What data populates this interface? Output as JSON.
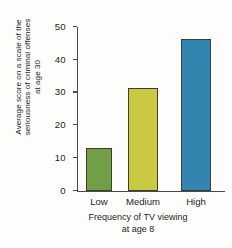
{
  "chart_data": {
    "type": "bar",
    "title": "",
    "categories": [
      "Low",
      "Medium",
      "High"
    ],
    "values": [
      12.5,
      31,
      46
    ],
    "series": [
      {
        "name": "Average seriousness score at age 30",
        "values": [
          12.5,
          31,
          46
        ]
      }
    ],
    "xlabel": "Frequency of TV viewing at age 8",
    "xlabel_lines": [
      "Frequency of TV viewing",
      "at age 8"
    ],
    "ylabel": "Average score on a scale of the seriousness of criminal offenses at age 30",
    "ylabel_lines": [
      "Average score on a scale of the",
      "seriousness of criminal offenses",
      "at age 30"
    ],
    "ylim": [
      0,
      50
    ],
    "yticks": [
      0,
      10,
      20,
      30,
      40,
      50
    ],
    "ytick_labels": [
      "0",
      "10",
      "20",
      "30",
      "40",
      "50"
    ],
    "grid": false,
    "legend": "none",
    "bar_colors": [
      "#6d9b3f",
      "#c8c83c",
      "#2b81ac"
    ],
    "bar_outline_color": "#3c3c3a",
    "axis_color": "#4a4a48",
    "background_color": "#fdfdfb"
  }
}
